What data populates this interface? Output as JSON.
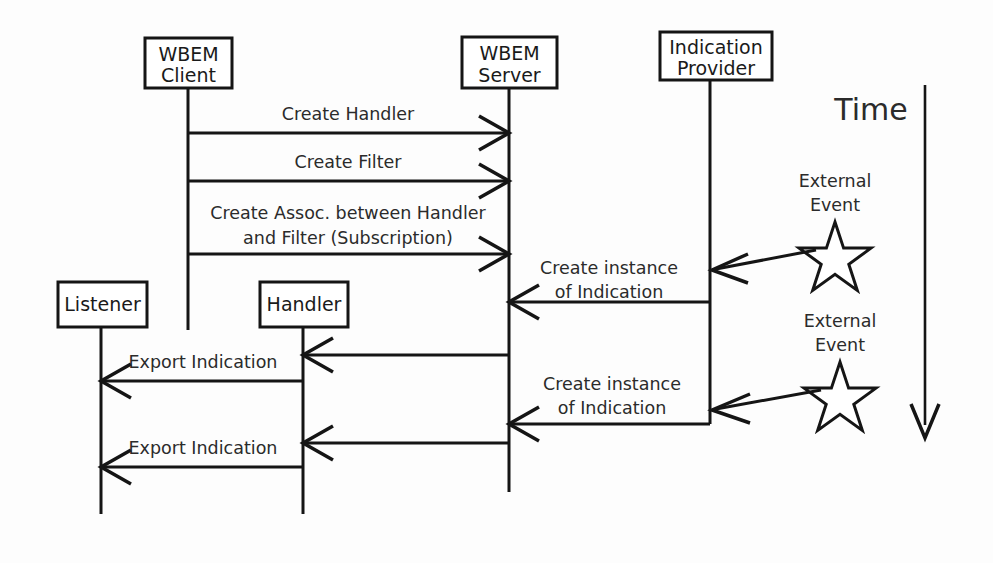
{
  "diagram": {
    "background_color": "#fdfdfd",
    "line_color": "#151515",
    "text_color": "#2b2b2b",
    "participants": [
      {
        "id": "wbem-client",
        "label_line1": "WBEM",
        "label_line2": "Client",
        "box": {
          "x": 145,
          "y": 38,
          "w": 87,
          "h": 50
        },
        "lifeline_x": 188,
        "lifeline_top": 88,
        "lifeline_bottom": 330
      },
      {
        "id": "wbem-server",
        "label_line1": "WBEM",
        "label_line2": "Server",
        "box": {
          "x": 462,
          "y": 37,
          "w": 95,
          "h": 51
        },
        "lifeline_x": 509,
        "lifeline_top": 88,
        "lifeline_bottom": 492
      },
      {
        "id": "indication-provider",
        "label_line1": "Indication",
        "label_line2": "Provider",
        "box": {
          "x": 660,
          "y": 32,
          "w": 112,
          "h": 48
        },
        "lifeline_x": 710,
        "lifeline_top": 80,
        "lifeline_bottom": 424
      },
      {
        "id": "listener",
        "label_line1": "Listener",
        "label_line2": "",
        "box": {
          "x": 58,
          "y": 282,
          "w": 89,
          "h": 45
        },
        "lifeline_x": 101,
        "lifeline_top": 327,
        "lifeline_bottom": 514
      },
      {
        "id": "handler",
        "label_line1": "Handler",
        "label_line2": "",
        "box": {
          "x": 260,
          "y": 282,
          "w": 88,
          "h": 45
        },
        "lifeline_x": 303,
        "lifeline_top": 327,
        "lifeline_bottom": 514
      }
    ],
    "messages": [
      {
        "id": "create-handler",
        "label_line1": "Create Handler",
        "label_line2": "",
        "from_x": 188,
        "to_x": 509,
        "y": 133,
        "label_y1": 114,
        "label_y2": 0,
        "direction": "right"
      },
      {
        "id": "create-filter",
        "label_line1": "Create Filter",
        "label_line2": "",
        "from_x": 188,
        "to_x": 509,
        "y": 181,
        "label_y1": 162,
        "label_y2": 0,
        "direction": "right"
      },
      {
        "id": "create-association",
        "label_line1": "Create Assoc. between Handler",
        "label_line2": "and Filter (Subscription)",
        "from_x": 188,
        "to_x": 509,
        "y": 254,
        "label_y1": 214,
        "label_y2": 239,
        "direction": "right"
      },
      {
        "id": "create-instance-1",
        "label_line1": "Create instance",
        "label_line2": "of Indication",
        "from_x": 710,
        "to_x": 509,
        "y": 302,
        "label_y1": 269,
        "label_y2": 293,
        "direction": "left"
      },
      {
        "id": "export-indication-1-server-handler",
        "label_line1": "",
        "label_line2": "",
        "from_x": 509,
        "to_x": 303,
        "y": 355,
        "label_y1": 0,
        "label_y2": 0,
        "direction": "left"
      },
      {
        "id": "export-indication-1-handler-listener",
        "label_line1": "Export Indication",
        "label_line2": "",
        "from_x": 303,
        "to_x": 101,
        "y": 381,
        "label_y1": 362,
        "label_y2": 0,
        "direction": "left"
      },
      {
        "id": "create-instance-2",
        "label_line1": "Create instance",
        "label_line2": "of Indication",
        "from_x": 710,
        "to_x": 509,
        "y": 424,
        "label_y1": 390,
        "label_y2": 414,
        "direction": "left"
      },
      {
        "id": "export-indication-2-server-handler",
        "label_line1": "",
        "label_line2": "",
        "from_x": 509,
        "to_x": 303,
        "y": 446,
        "label_y1": 0,
        "label_y2": 0,
        "direction": "left"
      },
      {
        "id": "export-indication-2-handler-listener",
        "label_line1": "Export Indication",
        "label_line2": "",
        "from_x": 303,
        "to_x": 101,
        "y": 467,
        "label_y1": 448,
        "label_y2": 0,
        "direction": "left"
      }
    ],
    "external_events": [
      {
        "id": "external-event-1",
        "label_line1": "External",
        "label_line2": "Event",
        "label_y1": 181,
        "label_y2": 206,
        "label_x": 835,
        "star_cx": 835,
        "star_cy": 256,
        "star_r": 36,
        "arrow_from_x": 818,
        "arrow_from_y": 248,
        "arrow_to_x": 714,
        "arrow_to_y": 269
      },
      {
        "id": "external-event-2",
        "label_line1": "External",
        "label_line2": "Event",
        "label_y1": 321,
        "label_y2": 346,
        "label_x": 840,
        "star_cx": 840,
        "star_cy": 396,
        "star_r": 36,
        "arrow_from_x": 822,
        "arrow_from_y": 389,
        "arrow_to_x": 714,
        "arrow_to_y": 409
      }
    ],
    "time_axis": {
      "label": "Time",
      "label_x": 871,
      "label_y": 120,
      "x": 925,
      "y_top": 85,
      "y_bottom": 438
    }
  }
}
